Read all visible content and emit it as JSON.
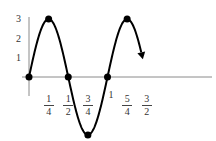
{
  "chart_data": {
    "type": "line",
    "title": "",
    "xlabel": "",
    "ylabel": "",
    "function": "y = 3 sin(2πx)",
    "x_range": [
      0,
      1.5
    ],
    "ylim": [
      -3,
      3
    ],
    "grid": false,
    "legend": null,
    "y_tick_labels": [
      "1",
      "2",
      "3"
    ],
    "y_ticks": [
      1,
      2,
      3
    ],
    "x_tick_labels": [
      {
        "num": "1",
        "den": "4",
        "value": 0.25
      },
      {
        "num": "1",
        "den": "2",
        "value": 0.5
      },
      {
        "num": "3",
        "den": "4",
        "value": 0.75
      },
      {
        "num": "1",
        "den": "",
        "value": 1.0
      },
      {
        "num": "5",
        "den": "4",
        "value": 1.25
      },
      {
        "num": "3",
        "den": "2",
        "value": 1.5
      }
    ],
    "points": [
      {
        "x": 0,
        "y": 0
      },
      {
        "x": 0.25,
        "y": 3
      },
      {
        "x": 0.5,
        "y": 0
      },
      {
        "x": 0.75,
        "y": -3
      },
      {
        "x": 1.0,
        "y": 0
      },
      {
        "x": 1.25,
        "y": 3
      }
    ],
    "end_arrow": {
      "x": 1.5,
      "y": -0.9
    },
    "colors": {
      "curve": "#000000",
      "axis": "#888888",
      "labels": "#333333"
    }
  }
}
